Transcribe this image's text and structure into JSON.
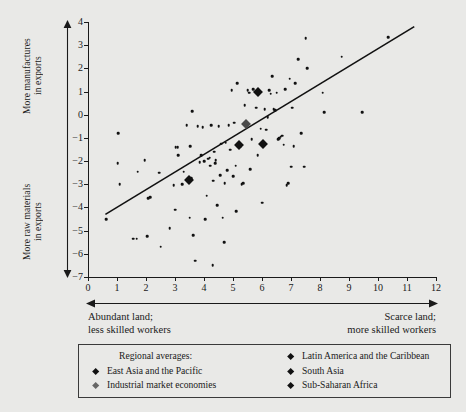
{
  "axes": {
    "y_top_label": "More manufactures\nin exports",
    "y_bottom_label": "More raw materials\nin exports",
    "x_left_label": "Abundant land;\nless skilled workers",
    "x_right_label": "Scarce land;\nmore skilled workers"
  },
  "legend": {
    "heading": "Regional averages:",
    "items": [
      {
        "label": "East Asia and the Pacific",
        "style": "dark"
      },
      {
        "label": "Industrial market economies",
        "style": "light"
      },
      {
        "label": "Latin America and the Caribbean",
        "style": "dark"
      },
      {
        "label": "South Asia",
        "style": "dark"
      },
      {
        "label": "Sub-Saharan Africa",
        "style": "dark"
      }
    ]
  },
  "chart_data": {
    "type": "scatter",
    "title": "",
    "xlabel": "Abundant land; less skilled workers  →  Scarce land; more skilled workers",
    "ylabel": "More raw materials in exports  →  More manufactures in exports",
    "xlim": [
      0,
      12
    ],
    "ylim": [
      -7,
      4
    ],
    "xticks": [
      0,
      1,
      2,
      3,
      4,
      5,
      6,
      7,
      8,
      9,
      10,
      11,
      12
    ],
    "yticks": [
      4,
      3,
      2,
      1,
      0,
      -1,
      -2,
      -3,
      -4,
      -5,
      -6,
      -7
    ],
    "ytick_labels": [
      "4",
      "3",
      "2",
      "1",
      "0",
      "−1",
      "−2",
      "−3",
      "−4",
      "−5",
      "−6",
      "−7"
    ],
    "grid": false,
    "legend_position": "below",
    "marker_color": "#111111",
    "fit_line": {
      "x": [
        0.6,
        11.25
      ],
      "y": [
        -4.3,
        3.8
      ],
      "color": "#111111"
    },
    "points": [
      [
        0.62,
        -4.5
      ],
      [
        1.05,
        -0.8
      ],
      [
        1.02,
        -2.1
      ],
      [
        1.1,
        -3.0
      ],
      [
        1.55,
        -5.35
      ],
      [
        1.68,
        -5.35
      ],
      [
        1.72,
        -2.45
      ],
      [
        1.95,
        -1.95
      ],
      [
        2.05,
        -5.25
      ],
      [
        2.08,
        -3.6
      ],
      [
        2.15,
        -3.55
      ],
      [
        2.45,
        -2.5
      ],
      [
        2.5,
        -5.7
      ],
      [
        2.82,
        -4.9
      ],
      [
        2.95,
        -3.05
      ],
      [
        3.0,
        -4.1
      ],
      [
        3.02,
        -1.4
      ],
      [
        3.1,
        -1.4
      ],
      [
        3.12,
        -1.75
      ],
      [
        3.25,
        -3.0
      ],
      [
        3.3,
        -2.45
      ],
      [
        3.4,
        -0.45
      ],
      [
        3.45,
        -2.8
      ],
      [
        3.5,
        -4.45
      ],
      [
        3.52,
        -1.35
      ],
      [
        3.55,
        -2.75
      ],
      [
        3.6,
        0.15
      ],
      [
        3.62,
        -5.2
      ],
      [
        3.7,
        -6.3
      ],
      [
        3.78,
        -0.5
      ],
      [
        3.85,
        -2.05
      ],
      [
        3.9,
        -1.75
      ],
      [
        3.95,
        -0.55
      ],
      [
        4.0,
        -2.0
      ],
      [
        4.05,
        -4.5
      ],
      [
        4.1,
        -3.5
      ],
      [
        4.15,
        -1.9
      ],
      [
        4.2,
        -1.85
      ],
      [
        4.22,
        -2.2
      ],
      [
        4.25,
        -0.45
      ],
      [
        4.3,
        -6.5
      ],
      [
        4.32,
        -2.85
      ],
      [
        4.35,
        -1.6
      ],
      [
        4.38,
        -2.1
      ],
      [
        4.4,
        -1.95
      ],
      [
        4.45,
        -3.9
      ],
      [
        4.5,
        -0.5
      ],
      [
        4.55,
        -2.6
      ],
      [
        4.6,
        -1.25
      ],
      [
        4.65,
        -4.45
      ],
      [
        4.7,
        -5.5
      ],
      [
        4.72,
        -2.95
      ],
      [
        4.75,
        -1.2
      ],
      [
        4.8,
        -2.4
      ],
      [
        4.85,
        -0.45
      ],
      [
        4.9,
        -1.5
      ],
      [
        4.95,
        1.05
      ],
      [
        5.0,
        -2.65
      ],
      [
        5.05,
        -0.35
      ],
      [
        5.1,
        -2.2
      ],
      [
        5.12,
        -4.15
      ],
      [
        5.15,
        1.35
      ],
      [
        5.2,
        -1.3
      ],
      [
        5.25,
        -1.35
      ],
      [
        5.3,
        -3.0
      ],
      [
        5.35,
        -2.95
      ],
      [
        5.4,
        0.4
      ],
      [
        5.45,
        -0.4
      ],
      [
        5.5,
        1.05
      ],
      [
        5.55,
        0.95
      ],
      [
        5.6,
        -2.35
      ],
      [
        5.65,
        -1.05
      ],
      [
        5.7,
        1.1
      ],
      [
        5.75,
        1.0
      ],
      [
        5.78,
        0.95
      ],
      [
        5.8,
        0.3
      ],
      [
        5.85,
        -1.75
      ],
      [
        5.9,
        1.0
      ],
      [
        5.92,
        0.95
      ],
      [
        5.95,
        -0.6
      ],
      [
        6.0,
        -3.8
      ],
      [
        6.05,
        -1.25
      ],
      [
        6.1,
        0.25
      ],
      [
        6.15,
        -0.65
      ],
      [
        6.2,
        -0.1
      ],
      [
        6.25,
        1.05
      ],
      [
        6.3,
        0.9
      ],
      [
        6.35,
        1.65
      ],
      [
        6.4,
        0.25
      ],
      [
        6.45,
        0.2
      ],
      [
        6.5,
        0.95
      ],
      [
        6.55,
        -1.05
      ],
      [
        6.6,
        -1.0
      ],
      [
        6.65,
        -0.95
      ],
      [
        6.7,
        -0.9
      ],
      [
        6.75,
        -1.3
      ],
      [
        6.8,
        1.1
      ],
      [
        6.85,
        -3.05
      ],
      [
        6.9,
        -2.95
      ],
      [
        6.95,
        1.55
      ],
      [
        7.0,
        -2.25
      ],
      [
        7.05,
        0.3
      ],
      [
        7.1,
        -1.35
      ],
      [
        7.15,
        1.35
      ],
      [
        7.25,
        2.4
      ],
      [
        7.35,
        -0.8
      ],
      [
        7.45,
        -2.25
      ],
      [
        7.5,
        3.3
      ],
      [
        7.55,
        2.0
      ],
      [
        8.1,
        0.95
      ],
      [
        8.15,
        0.1
      ],
      [
        8.75,
        2.5
      ],
      [
        9.45,
        0.1
      ],
      [
        10.35,
        3.35
      ]
    ],
    "regional_averages": [
      {
        "name": "East Asia and the Pacific",
        "x": 5.85,
        "y": 1.0,
        "style": "dark"
      },
      {
        "name": "Industrial market economies",
        "x": 5.45,
        "y": -0.4,
        "style": "light"
      },
      {
        "name": "Latin America and the Caribbean",
        "x": 6.05,
        "y": -1.25,
        "style": "dark"
      },
      {
        "name": "South Asia",
        "x": 5.22,
        "y": -1.3,
        "style": "dark"
      },
      {
        "name": "Sub-Saharan Africa",
        "x": 3.47,
        "y": -2.8,
        "style": "dark"
      }
    ]
  }
}
